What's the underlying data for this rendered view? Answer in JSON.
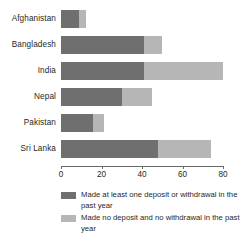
{
  "chart_data": {
    "type": "bar",
    "orientation": "horizontal",
    "stacked": true,
    "title": "",
    "subtitle": "",
    "xlabel": "",
    "ylabel": "",
    "xlim": [
      0,
      80
    ],
    "grid": false,
    "legend_position": "bottom",
    "categories": [
      "Afghanistan",
      "Bangladesh",
      "India",
      "Nepal",
      "Pakistan",
      "Sri Lanka"
    ],
    "tick_labels": [
      "0",
      "20",
      "40",
      "60",
      "80"
    ],
    "ticks": [
      0,
      20,
      40,
      60,
      80
    ],
    "series": [
      {
        "name": "Made at least one deposit or withdrawal in the past year",
        "color": "#6f6f6f",
        "values": [
          9,
          41,
          41,
          30,
          16,
          48
        ]
      },
      {
        "name": "Made no deposit and no withdrawal in the past year",
        "color": "#b6b6b6",
        "values": [
          3.5,
          9,
          39,
          15,
          5,
          26
        ]
      }
    ],
    "totals": [
      12.5,
      50,
      80,
      45,
      21,
      74
    ]
  },
  "axis": {
    "ticks": [
      {
        "label": "0",
        "value": 0
      },
      {
        "label": "20",
        "value": 20
      },
      {
        "label": "40",
        "value": 40
      },
      {
        "label": "60",
        "value": 60
      },
      {
        "label": "80",
        "value": 80
      }
    ]
  },
  "legend": {
    "items": [
      {
        "label": "Made at least one deposit or withdrawal in the past year",
        "color": "#6f6f6f"
      },
      {
        "label": "Made no deposit and no withdrawal in the past year",
        "color": "#b6b6b6"
      }
    ]
  }
}
